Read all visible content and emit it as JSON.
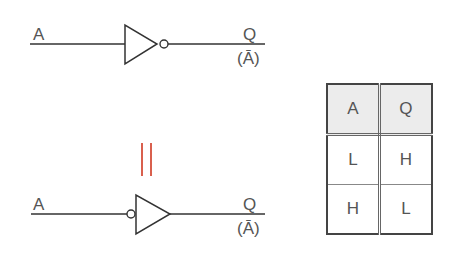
{
  "top_gate": {
    "input_label": "A",
    "output_label": "Q",
    "output_expr": "(Ā)"
  },
  "bottom_gate": {
    "input_label": "A",
    "output_label": "Q",
    "output_expr": "(Ā)"
  },
  "equivalence_symbol": "||",
  "colors": {
    "line": "#333333",
    "equals": "#d9604e",
    "header_bg": "#ececec"
  },
  "truth_table": {
    "headers": [
      "A",
      "Q"
    ],
    "rows": [
      [
        "L",
        "H"
      ],
      [
        "H",
        "L"
      ]
    ]
  }
}
